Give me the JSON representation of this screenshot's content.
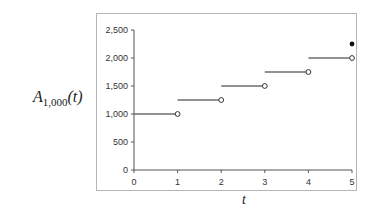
{
  "chart_data": {
    "type": "line",
    "subtype": "step-function",
    "title": "",
    "xlabel": "t",
    "ylabel": "A_{1,000}(t)",
    "ylabel_parts": {
      "base": "A",
      "sub": "1,000",
      "arg": "(t)"
    },
    "xlim": [
      0,
      5
    ],
    "ylim": [
      0,
      2500
    ],
    "x_ticks": [
      "0",
      "1",
      "2",
      "3",
      "4",
      "5"
    ],
    "y_ticks": [
      "0",
      "500",
      "1,000",
      "1,500",
      "2,000",
      "2,500"
    ],
    "grid": false,
    "legend": null,
    "segments": [
      {
        "x_start": 0,
        "x_end": 1,
        "y": 1000,
        "left_closed": true,
        "right_open": true
      },
      {
        "x_start": 1,
        "x_end": 2,
        "y": 1250,
        "left_closed": true,
        "right_open": true
      },
      {
        "x_start": 2,
        "x_end": 3,
        "y": 1500,
        "left_closed": true,
        "right_open": true
      },
      {
        "x_start": 3,
        "x_end": 4,
        "y": 1750,
        "left_closed": true,
        "right_open": true
      },
      {
        "x_start": 4,
        "x_end": 5,
        "y": 2000,
        "left_closed": true,
        "right_open": true
      }
    ],
    "points": [
      {
        "x": 5,
        "y": 2250,
        "filled": true
      }
    ],
    "colors": {
      "segment": "#6e6e6e",
      "axis": "#555555",
      "frame": "#b5b5b5",
      "dot": "#111111"
    }
  }
}
